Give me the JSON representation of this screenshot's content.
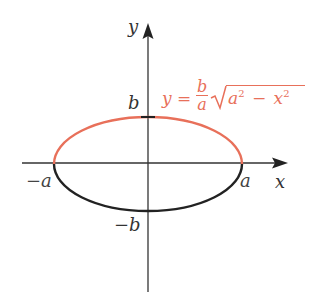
{
  "diagram": {
    "type": "ellipse-graph",
    "colors": {
      "upper_half": "#e8705a",
      "lower_half": "#222222",
      "axes": "#333333",
      "equation": "#e8705a",
      "labels": "#333333"
    },
    "axes": {
      "x_label": "x",
      "y_label": "y"
    },
    "ticks": {
      "neg_a": "−a",
      "pos_a": "a",
      "pos_b": "b",
      "neg_b": "−b"
    },
    "equation": {
      "lhs": "y =",
      "frac_num": "b",
      "frac_den": "a",
      "radicand_a": "a",
      "radicand_minus": "−",
      "radicand_x": "x",
      "exp": "2"
    }
  }
}
